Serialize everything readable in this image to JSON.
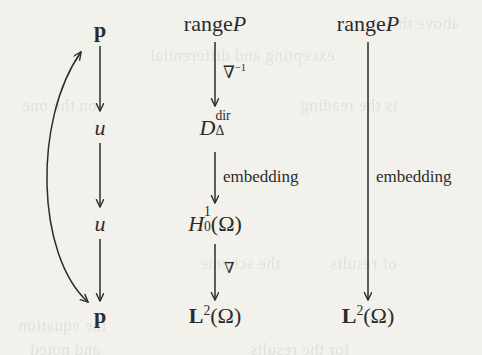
{
  "diagram": {
    "type": "commutative-diagram",
    "background_color": "#f3f1ec",
    "ink_color": "#2b2b2b",
    "columns": [
      {
        "id": "left",
        "x": 100,
        "nodes": [
          {
            "id": "p-top",
            "label": "p",
            "style": "bold-upright",
            "y": 30
          },
          {
            "id": "u-upper",
            "label": "u",
            "style": "italic",
            "y": 128
          },
          {
            "id": "u-lower",
            "label": "u",
            "style": "italic",
            "y": 224
          },
          {
            "id": "p-bottom",
            "label": "p",
            "style": "bold-upright",
            "y": 316
          }
        ]
      },
      {
        "id": "middle",
        "x": 215,
        "nodes": [
          {
            "id": "range-p-mid",
            "label_roman": "range",
            "label_italic": "P",
            "y": 24
          },
          {
            "id": "d-delta-dir",
            "base": "D",
            "superscript": "dir",
            "subscript": "Δ",
            "y": 128
          },
          {
            "id": "h-1-0-omega",
            "base": "H",
            "superscript": "1",
            "subscript": "0",
            "suffix": "(Ω)",
            "y": 224
          },
          {
            "id": "l2-omega-mid",
            "base": "L",
            "superscript": "2",
            "suffix": "(Ω)",
            "y": 316
          }
        ]
      },
      {
        "id": "right",
        "x": 368,
        "nodes": [
          {
            "id": "range-p-right",
            "label_roman": "range",
            "label_italic": "P",
            "y": 24
          },
          {
            "id": "l2-omega-right",
            "base": "L",
            "superscript": "2",
            "suffix": "(Ω)",
            "y": 316
          }
        ]
      }
    ],
    "arrows": [
      {
        "id": "left-p-to-u-upper",
        "from": "p-top",
        "to": "u-upper",
        "kind": "straight-down",
        "label": ""
      },
      {
        "id": "left-u-to-u",
        "from": "u-upper",
        "to": "u-lower",
        "kind": "straight-down",
        "label": ""
      },
      {
        "id": "left-u-to-p-bottom",
        "from": "u-lower",
        "to": "p-bottom",
        "kind": "straight-down",
        "label": ""
      },
      {
        "id": "left-curved-bidirectional",
        "from": "p-bottom",
        "to": "p-top",
        "kind": "curved-double-headed",
        "label": ""
      },
      {
        "id": "mid-range-to-d",
        "from": "range-p-mid",
        "to": "d-delta-dir",
        "kind": "straight-down",
        "label_base": "∇",
        "label_superscript": "−1"
      },
      {
        "id": "mid-d-to-h",
        "from": "d-delta-dir",
        "to": "h-1-0-omega",
        "kind": "straight-down",
        "label": "embedding"
      },
      {
        "id": "mid-h-to-l2",
        "from": "h-1-0-omega",
        "to": "l2-omega-mid",
        "kind": "straight-down",
        "label": "∇"
      },
      {
        "id": "right-range-to-l2",
        "from": "range-p-right",
        "to": "l2-omega-right",
        "kind": "straight-down",
        "label": "embedding"
      }
    ],
    "labels": {
      "nabla_inverse_base": "∇",
      "nabla_inverse_exp": "−1",
      "nabla": "∇",
      "embedding": "embedding",
      "range_roman": "range",
      "range_italic_p": "P",
      "bold_p": "p",
      "italic_u": "u",
      "omega_suffix": "(Ω)",
      "d_base": "D",
      "d_sup": "dir",
      "d_sub": "Δ",
      "h_base": "H",
      "h_sup": "1",
      "h_sub": "0",
      "l_base": "L",
      "l_sup": "2"
    },
    "bleed_through": [
      {
        "text": "excepting and differential",
        "x": 150,
        "y": 46
      },
      {
        "text": "on the one",
        "x": 22,
        "y": 96
      },
      {
        "text": "is the reading",
        "x": 300,
        "y": 96
      },
      {
        "text": "the scheme",
        "x": 200,
        "y": 254
      },
      {
        "text": "of results",
        "x": 330,
        "y": 254
      },
      {
        "text": "the equation",
        "x": 18,
        "y": 316
      },
      {
        "text": "for the results",
        "x": 250,
        "y": 340
      },
      {
        "text": "and noted",
        "x": 30,
        "y": 340
      },
      {
        "text": "above the",
        "x": 390,
        "y": 14
      }
    ]
  }
}
